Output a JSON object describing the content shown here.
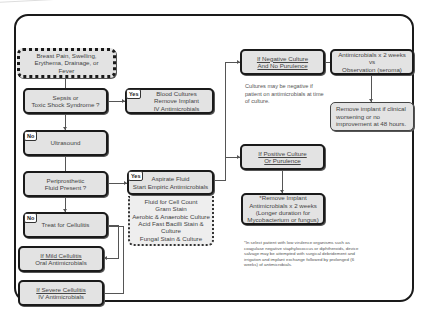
{
  "diagram": {
    "start": {
      "text": "Breast Pain, Swelling, Erythema, Drainage, or Fever"
    },
    "sepsis": {
      "line1": "Sepsis or",
      "line2": "Toxic Shock Syndrome ?"
    },
    "sepsis_yes": {
      "tag": "Yes",
      "line1": "Blood Cultures",
      "line2": "Remove Implant",
      "line3": "IV Antimicrobials"
    },
    "ultrasound": {
      "tag": "No",
      "text": "Ultrasound"
    },
    "periprosthetic": {
      "line1": "Periprosthetic",
      "line2": "Fluid Present ?"
    },
    "fluid_yes": {
      "tag": "Yes",
      "line1": "Aspirate Fluid",
      "line2": "Start Empiric Antimicrobials"
    },
    "fluid_tests": [
      "Fluid for Cell Count",
      "Gram Stain",
      "Aerobic & Anaerobic Culture",
      "Acid Fast Bacilli Stain & Culture",
      "Fungal Stain & Culture"
    ],
    "cellulitis": {
      "tag": "No",
      "text": "Treat for Cellulitis"
    },
    "mild": {
      "line1": "If Mild Cellulitis",
      "line2": "Oral Antimicrobials"
    },
    "severe": {
      "line1": "If Severe Cellulitis",
      "line2": "IV Antimicrobials"
    },
    "negative": {
      "line1": "If Negative Culture",
      "line2": "And No Purulence"
    },
    "negative_action": {
      "line1": "Antimicrobials x 2 weeks",
      "line2": "vs",
      "line3": "Observation (seroma)"
    },
    "negative_note": "Cultures may be negative if patient on antimicrobials at time of culture.",
    "negative_followup": "Remove implant if clinical worsening or no improvement at 48 hours.",
    "positive": {
      "line1": "If Positive Culture",
      "line2": "Or Purulence"
    },
    "positive_action": {
      "line1": "*Remove Implant",
      "line2": "Antimicrobials x 2 weeks",
      "line3": "(Longer duration for",
      "line4": "Mycobacterium or fungus)"
    },
    "footnote": "*In select patient with low virulence organisms such as coagulase negative staphylococcus or diphtheroids, device salvage may be attempted with surgical debridement and irrigation and implant exchange followed by prolonged (6 weeks) of antimicrobials."
  }
}
